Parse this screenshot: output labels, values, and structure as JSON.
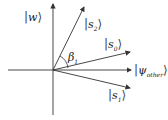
{
  "diagram": {
    "type": "vector-diagram",
    "origin": {
      "x": 53,
      "y": 70
    },
    "axes": {
      "horizontal": {
        "x1": 8,
        "x2": 131,
        "y": 70
      },
      "vertical": {
        "x": 53,
        "y1": 115,
        "y2": 4
      }
    },
    "vectors": [
      {
        "name": "s2",
        "label": "s",
        "subscript": "2",
        "tip": {
          "x": 84,
          "y": 6
        }
      },
      {
        "name": "s0",
        "label": "s",
        "subscript": "0",
        "tip": {
          "x": 130,
          "y": 52
        }
      },
      {
        "name": "psi_other",
        "label": "ψ",
        "subscript": "other",
        "tip": {
          "x": 131,
          "y": 71
        }
      },
      {
        "name": "s1",
        "label": "s",
        "subscript": "1",
        "tip": {
          "x": 130,
          "y": 88
        }
      }
    ],
    "axis_labels": {
      "vertical": {
        "label": "w"
      }
    },
    "angle": {
      "label": "β",
      "subscript": "1"
    },
    "ket_left": "|",
    "ket_right": "⟩",
    "colors": {
      "line": "#333333",
      "text": "#222222"
    }
  }
}
